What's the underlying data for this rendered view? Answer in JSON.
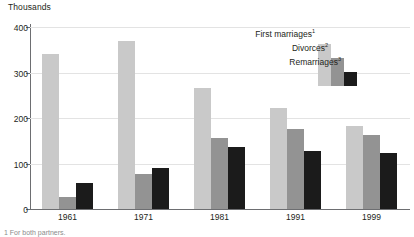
{
  "chart_data": {
    "type": "bar",
    "title": "",
    "subtitle": "",
    "axis_title": "Thousands",
    "xlabel": "",
    "ylabel": "Thousands",
    "categories": [
      "1961",
      "1971",
      "1981",
      "1991",
      "1999"
    ],
    "series": [
      {
        "name": "First marriages",
        "footnote_marker": "1",
        "color": "#c9c9c9",
        "values": [
          340,
          370,
          265,
          223,
          182
        ]
      },
      {
        "name": "Divorces",
        "footnote_marker": "2",
        "color": "#939393",
        "values": [
          27,
          78,
          157,
          176,
          162
        ]
      },
      {
        "name": "Remarriages",
        "footnote_marker": "3",
        "color": "#1b1b1b",
        "values": [
          57,
          91,
          137,
          128,
          123
        ]
      }
    ],
    "ylim": [
      0,
      400
    ],
    "yticks": [
      0,
      100,
      200,
      300,
      400
    ],
    "ytick_labels": [
      "0",
      "100",
      "200",
      "300",
      "400"
    ],
    "grid": true,
    "legend_position": "top-right"
  },
  "footnote": {
    "text": "1  For both partners."
  },
  "colors": {
    "gridline": "#e3e3e3",
    "axis": "#6d6e71",
    "text": "#231f20"
  }
}
